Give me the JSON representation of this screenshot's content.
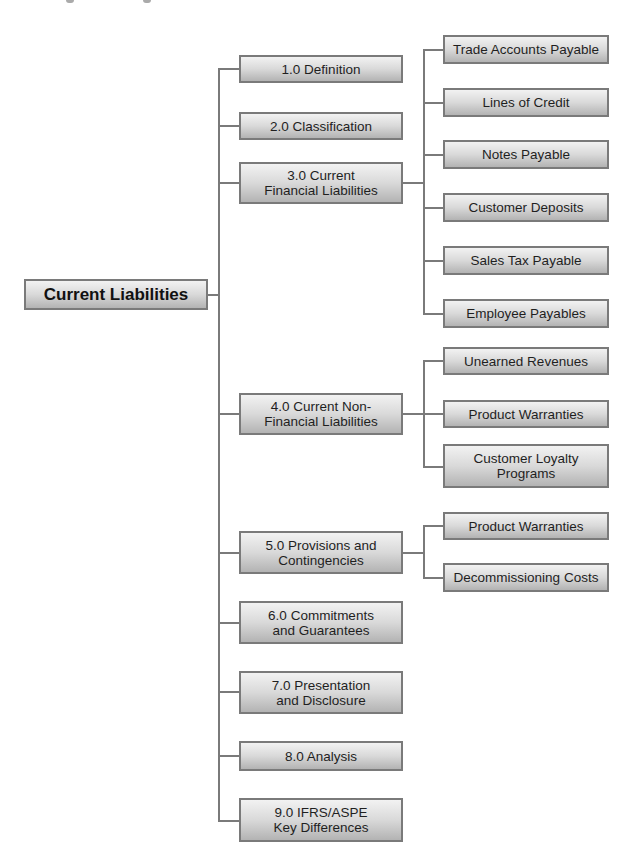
{
  "diagram": {
    "root": {
      "label": "Current Liabilities"
    },
    "sections": [
      {
        "label": "1.0 Definition",
        "children": []
      },
      {
        "label": "2.0 Classification",
        "children": []
      },
      {
        "label": "3.0 Current Financial Liabilities",
        "line1": "3.0 Current",
        "line2": "Financial Liabilities",
        "children": [
          "Trade Accounts Payable",
          "Lines of Credit",
          "Notes Payable",
          "Customer Deposits",
          "Sales Tax Payable",
          "Employee Payables"
        ]
      },
      {
        "label": "4.0 Current Non-Financial Liabilities",
        "line1": "4.0 Current Non-",
        "line2": "Financial Liabilities",
        "children": [
          "Unearned Revenues",
          "Product Warranties",
          "Customer Loyalty Programs"
        ],
        "children_lines": {
          "2": {
            "line1": "Customer Loyalty",
            "line2": "Programs"
          }
        }
      },
      {
        "label": "5.0 Provisions and Contingencies",
        "line1": "5.0 Provisions and",
        "line2": "Contingencies",
        "children": [
          "Product Warranties",
          "Decommissioning Costs"
        ]
      },
      {
        "label": "6.0 Commitments and Guarantees",
        "line1": "6.0 Commitments",
        "line2": "and Guarantees",
        "children": []
      },
      {
        "label": "7.0 Presentation and Disclosure",
        "line1": "7.0 Presentation",
        "line2": "and Disclosure",
        "children": []
      },
      {
        "label": "8.0 Analysis",
        "children": []
      },
      {
        "label": "9.0 IFRS/ASPE Key Differences",
        "line1": "9.0 IFRS/ASPE",
        "line2": "Key Differences",
        "children": []
      }
    ]
  },
  "colors": {
    "connector": "#7a7a7a",
    "box_border": "#7a7a7a",
    "box_gradient_top": "#f2f2f2",
    "box_gradient_bottom": "#b3b3b3",
    "text": "#1f1f1f"
  }
}
